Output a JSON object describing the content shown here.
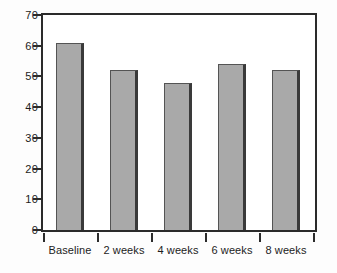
{
  "chart_data": {
    "type": "bar",
    "title": "",
    "subtitle": "",
    "xlabel": "",
    "ylabel": "",
    "categories": [
      "Baseline",
      "2 weeks",
      "4 weeks",
      "6 weeks",
      "8 weeks"
    ],
    "values": [
      61,
      52,
      48,
      54,
      52
    ],
    "ylim": [
      0,
      70
    ],
    "ytick_labels": [
      "0",
      "10",
      "20",
      "30",
      "40",
      "50",
      "60",
      "70"
    ],
    "ytick_values": [
      0,
      10,
      20,
      30,
      40,
      50,
      60,
      70
    ],
    "grid": false,
    "legend": null,
    "legend_position": "none",
    "annotations": [],
    "colors": {
      "bar_fill": "#a9a9a9",
      "bar_edge": "#545454",
      "bar_shadow": "#3a3a3a",
      "axis": "#2b2b2b",
      "text": "#1c1c1c",
      "plot_background": "#ffffff",
      "figure_background": "#fdfdfd"
    }
  }
}
